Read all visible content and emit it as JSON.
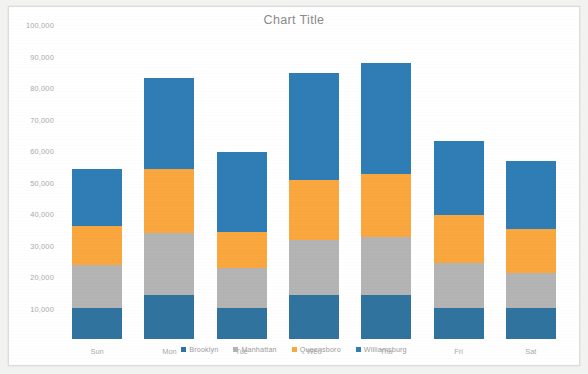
{
  "chart": {
    "title": "Chart Title"
  },
  "chart_data": {
    "type": "bar",
    "subtype": "stacked-column",
    "title": "Chart Title",
    "xlabel": "",
    "ylabel": "",
    "categories": [
      "Sun",
      "Mon",
      "Tue",
      "Wed",
      "Thu",
      "Fri",
      "Sat"
    ],
    "series": [
      {
        "name": "Brooklyn",
        "color": "#31739f",
        "values": [
          10000,
          14000,
          10000,
          14000,
          14000,
          10000,
          10000
        ]
      },
      {
        "name": "Manhattan",
        "color": "#b4b4b4",
        "values": [
          13500,
          19500,
          12500,
          17500,
          18500,
          14000,
          11000
        ]
      },
      {
        "name": "Queensboro",
        "color": "#f9a73e",
        "values": [
          12500,
          20500,
          11500,
          19000,
          20000,
          15500,
          14000
        ]
      },
      {
        "name": "Williamsburg",
        "color": "#2e7db5",
        "values": [
          18000,
          29000,
          25500,
          34000,
          35000,
          23500,
          21500
        ]
      }
    ],
    "totals": [
      54000,
      83000,
      59500,
      84500,
      87500,
      63000,
      56500
    ],
    "ylim": [
      0,
      100000
    ],
    "ytick_step": 10000,
    "yticks": [
      "10,000",
      "20,000",
      "30,000",
      "40,000",
      "50,000",
      "60,000",
      "70,000",
      "80,000",
      "90,000",
      "100,000"
    ],
    "grid": false,
    "legend_position": "bottom",
    "legend": [
      "Brooklyn",
      "Manhattan",
      "Queensboro",
      "Williamsburg"
    ]
  }
}
